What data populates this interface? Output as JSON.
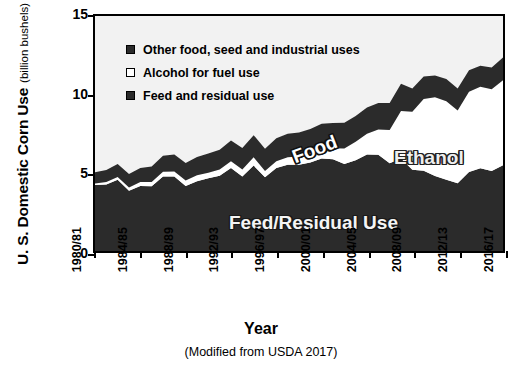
{
  "chart_data": {
    "type": "area",
    "stacked": true,
    "title": "",
    "xlabel": "Year",
    "ylabel": "U. S. Domestic Corn Use",
    "ylabel_units": "(billion bushels)",
    "caption": "(Modified from USDA 2017)",
    "ylim": [
      0,
      15
    ],
    "yticks": [
      0,
      5,
      10,
      15
    ],
    "grid": false,
    "legend_position": "inside-top-left",
    "x": [
      "1980/81",
      "1981/82",
      "1982/83",
      "1983/84",
      "1984/85",
      "1985/86",
      "1986/87",
      "1987/88",
      "1988/89",
      "1989/90",
      "1990/91",
      "1991/92",
      "1992/93",
      "1993/94",
      "1994/95",
      "1995/96",
      "1996/97",
      "1997/98",
      "1998/99",
      "1999/00",
      "2000/01",
      "2001/02",
      "2002/03",
      "2003/04",
      "2004/05",
      "2005/06",
      "2006/07",
      "2007/08",
      "2008/09",
      "2009/10",
      "2010/11",
      "2011/12",
      "2012/13",
      "2013/14",
      "2014/15",
      "2015/16",
      "2016/17"
    ],
    "xtick_labels": [
      "1980/81",
      "1984/85",
      "1988/89",
      "1992/93",
      "1996/97",
      "2000/01",
      "2004/05",
      "2008/09",
      "2012/13",
      "2016/17"
    ],
    "xtick_indices": [
      0,
      4,
      8,
      12,
      16,
      20,
      24,
      28,
      32,
      36
    ],
    "series": [
      {
        "name": "Feed and residual use",
        "key": "feed",
        "color": "#2b2b2b",
        "values": [
          4.22,
          4.25,
          4.55,
          3.85,
          4.15,
          4.13,
          4.75,
          4.75,
          4.15,
          4.45,
          4.65,
          4.8,
          5.3,
          4.75,
          5.45,
          4.7,
          5.3,
          5.5,
          5.5,
          5.65,
          5.9,
          5.85,
          5.56,
          5.8,
          6.16,
          6.15,
          5.6,
          5.91,
          5.18,
          5.13,
          4.79,
          4.55,
          4.32,
          5.04,
          5.28,
          5.11,
          5.47
        ]
      },
      {
        "name": "Alcohol for fuel use",
        "key": "alcohol",
        "color": "#ffffff",
        "values": [
          0.09,
          0.15,
          0.18,
          0.21,
          0.25,
          0.28,
          0.31,
          0.33,
          0.35,
          0.38,
          0.35,
          0.4,
          0.43,
          0.46,
          0.53,
          0.4,
          0.43,
          0.48,
          0.53,
          0.57,
          0.63,
          0.71,
          0.99,
          1.17,
          1.32,
          1.6,
          2.12,
          3.03,
          3.71,
          4.57,
          5.02,
          5.01,
          4.65,
          5.13,
          5.2,
          5.21,
          5.43
        ]
      },
      {
        "name": "Other food, seed and industrial uses",
        "key": "food",
        "color": "#2b2b2b",
        "values": [
          0.72,
          0.77,
          0.82,
          0.85,
          0.9,
          0.98,
          1.02,
          1.08,
          1.12,
          1.17,
          1.22,
          1.27,
          1.32,
          1.36,
          1.41,
          1.43,
          1.46,
          1.5,
          1.54,
          1.56,
          1.59,
          1.61,
          1.63,
          1.65,
          1.68,
          1.7,
          1.72,
          1.73,
          1.49,
          1.44,
          1.4,
          1.42,
          1.4,
          1.37,
          1.35,
          1.4,
          1.45
        ]
      }
    ],
    "annotations": [
      {
        "text": "Food",
        "key": "food_label"
      },
      {
        "text": "Ethanol",
        "key": "ethanol_label"
      },
      {
        "text": "Feed/Residual Use",
        "key": "feed_label"
      }
    ]
  },
  "legend": {
    "items": [
      {
        "label": "Other food, seed and industrial uses",
        "swatch": "filled"
      },
      {
        "label": "Alcohol for fuel use",
        "swatch": "hollow"
      },
      {
        "label": "Feed and residual use",
        "swatch": "filled"
      }
    ]
  },
  "axis": {
    "y_title_main": "U. S. Domestic Corn Use",
    "y_title_sub": "(billion bushels)",
    "x_title": "Year"
  },
  "colors": {
    "dark": "#2b2b2b",
    "white_band": "#ffffff",
    "plot_bg": "#f2f2f2",
    "axis": "#000000"
  }
}
